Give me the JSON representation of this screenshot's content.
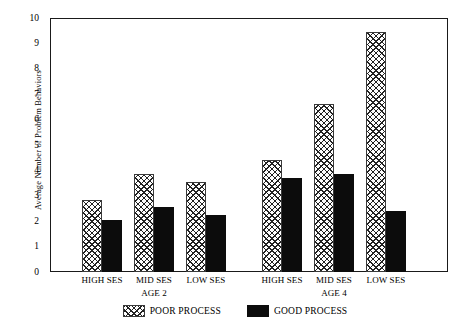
{
  "chart_data": {
    "type": "bar",
    "title": "",
    "xlabel": "",
    "ylabel": "Average Number of Problem Behaviors",
    "ylim": [
      0,
      10
    ],
    "ytick_labels": [
      "10",
      "9",
      "8",
      "7",
      "6",
      "5",
      "4",
      "3",
      "2",
      "1",
      "0"
    ],
    "yticks": [
      10,
      9,
      8,
      7,
      6,
      5,
      4,
      3,
      2,
      1,
      0
    ],
    "grid": false,
    "legend_position": "bottom-center",
    "categories": [
      "HIGH SES",
      "MID SES",
      "LOW SES",
      "HIGH SES",
      "MID SES",
      "LOW SES"
    ],
    "groups": [
      {
        "name": "AGE 2",
        "categories": [
          "HIGH SES",
          "MID SES",
          "LOW SES"
        ],
        "poor_process": [
          2.85,
          3.85,
          3.55
        ],
        "good_process": [
          2.05,
          2.55,
          2.25
        ]
      },
      {
        "name": "AGE 4",
        "categories": [
          "HIGH SES",
          "MID SES",
          "LOW SES"
        ],
        "poor_process": [
          4.4,
          6.6,
          9.45
        ],
        "good_process": [
          3.7,
          3.85,
          2.4
        ]
      }
    ],
    "series": [
      {
        "name": "POOR PROCESS",
        "color": "#ffffff",
        "pattern": "crosshatch",
        "values": [
          2.85,
          3.85,
          3.55,
          4.4,
          6.6,
          9.45
        ]
      },
      {
        "name": "GOOD PROCESS",
        "color": "#0c0c0c",
        "pattern": "solid",
        "values": [
          2.05,
          2.55,
          2.25,
          3.7,
          3.85,
          2.4
        ]
      }
    ],
    "legend": [
      {
        "label": "POOR PROCESS",
        "swatch": "crosshatch"
      },
      {
        "label": "GOOD PROCESS",
        "swatch": "solid-black"
      }
    ]
  }
}
